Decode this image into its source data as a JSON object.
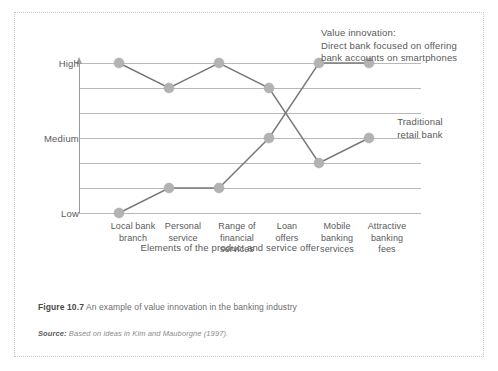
{
  "figure": {
    "caption_label": "Figure 10.7",
    "caption_text": "An example of value innovation in the banking industry",
    "source_label": "Source:",
    "source_text": "Based on ideas in Kim and Mauborgne (1997)."
  },
  "annotations": {
    "value_innovation": {
      "line1": "Value innovation:",
      "line2": "Direct bank focused on offering",
      "line3": "bank accounts on smartphones"
    },
    "traditional": {
      "line1": "Traditional",
      "line2": "retail bank"
    }
  },
  "chart_data": {
    "type": "line",
    "title": "An example of value innovation in the banking industry",
    "xlabel": "Elements of the product and service offer",
    "ylabel": "",
    "grid": true,
    "legend_position": "annotations-inline",
    "categories": [
      "Local bank branch",
      "Personal service",
      "Range of financial services",
      "Loan offers",
      "Mobile banking services",
      "Attractive banking fees"
    ],
    "category_lines": [
      [
        "Local bank",
        "branch"
      ],
      [
        "Personal",
        "service"
      ],
      [
        "Range of",
        "financial",
        "services"
      ],
      [
        "Loan",
        "offers"
      ],
      [
        "Mobile",
        "banking",
        "services"
      ],
      [
        "Attractive",
        "banking",
        "fees"
      ]
    ],
    "ytick_labels": [
      "High",
      "Medium",
      "Low"
    ],
    "ytick_values": [
      6,
      3,
      0
    ],
    "ylim": [
      0,
      6
    ],
    "gridline_values": [
      6,
      5,
      4,
      3,
      2,
      1,
      0
    ],
    "series": [
      {
        "name": "Traditional retail bank",
        "values": [
          6,
          5,
          6,
          5,
          2,
          3
        ],
        "color": "#7a7a7a"
      },
      {
        "name": "Value innovation: Direct bank focused on offering bank accounts on smartphones",
        "values": [
          0,
          1,
          1,
          3,
          6,
          6
        ],
        "color": "#7a7a7a"
      }
    ]
  },
  "colors": {
    "line": "#7a7a7a",
    "marker": "#b3b3b3",
    "gridline": "#b9b9b9",
    "axis": "#9a9a9a",
    "text": "#595959",
    "border": "#c9c9c9"
  }
}
